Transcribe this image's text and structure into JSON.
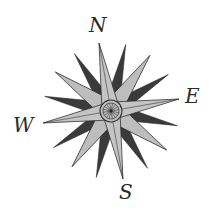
{
  "figure": {
    "type": "compass-rose",
    "labels": {
      "north": "N",
      "east": "E",
      "south": "S",
      "west": "W"
    },
    "colors": {
      "background": "#ffffff",
      "light_point": "#bdbdbd",
      "dark_point": "#3a3a3a",
      "outline": "#2a2a2a"
    },
    "rotation_deg": -10,
    "point_count": 16
  }
}
